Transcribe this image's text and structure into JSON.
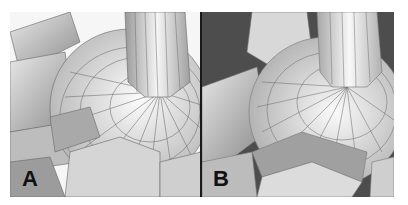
{
  "panels": [
    {
      "id": "A",
      "label": "A",
      "background": "#f4f4f4",
      "edge_color": "#5a5a5a",
      "description": "grey shaded 3D polygon mesh render with dense wireframe edges"
    },
    {
      "id": "B",
      "label": "B",
      "background": "#4a4a4a",
      "edge_color": "#6a6a6a",
      "description": "grey shaded 3D polygon mesh render with smoothed topology"
    }
  ],
  "colors": {
    "divider": "#1a1a1a",
    "label_text": "#111111",
    "mesh_light": "#f2f2f2",
    "mesh_mid": "#c8c8c8",
    "mesh_dark": "#8a8a8a"
  }
}
